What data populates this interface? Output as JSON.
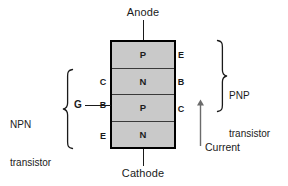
{
  "diagram": {
    "background_color": "#ffffff",
    "layer_fill_color": "#c9c9c9",
    "line_color": "#1a1a1a"
  },
  "terminals": {
    "anode": "Anode",
    "cathode": "Cathode",
    "gate": "G"
  },
  "layers": [
    {
      "material": "P",
      "left_label": "",
      "right_label": "E"
    },
    {
      "material": "N",
      "left_label": "C",
      "right_label": "B"
    },
    {
      "material": "P",
      "left_label": "B",
      "right_label": "C"
    },
    {
      "material": "N",
      "left_label": "E",
      "right_label": ""
    }
  ],
  "annotations": {
    "npn": {
      "line1": "NPN",
      "line2": "transistor"
    },
    "pnp": {
      "line1": "PNP",
      "line2": "transistor"
    },
    "current": "Current"
  }
}
